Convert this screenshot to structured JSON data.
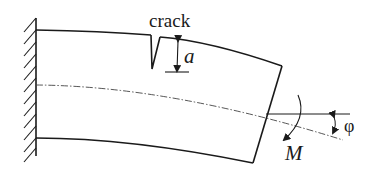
{
  "diagram": {
    "type": "cantilever-beam-with-crack",
    "labels": {
      "crack": "crack",
      "crack_depth": "a",
      "moment": "M",
      "rotation_angle": "φ"
    },
    "elements": [
      "fixed-wall-support",
      "beam-top-edge",
      "beam-bottom-edge",
      "beam-free-end",
      "crack-notch",
      "crack-depth-dimension-arrow",
      "neutral-axis-centerline",
      "horizontal-reference-line",
      "rotation-angle-arrow",
      "applied-moment-arrow"
    ],
    "colors": {
      "line": "#1a1a1a",
      "centerline": "#444444",
      "background": "#ffffff"
    }
  }
}
